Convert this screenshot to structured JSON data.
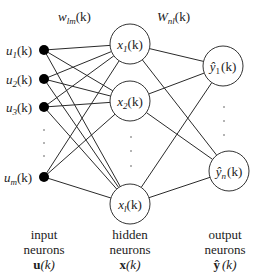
{
  "weights": {
    "input_hidden": {
      "base": "w",
      "sub": "lm",
      "arg": "(k)"
    },
    "hidden_output": {
      "base": "W",
      "sub": "nl",
      "arg": "(k)"
    }
  },
  "input_layer": {
    "nodes": [
      {
        "base": "u",
        "sub": "1",
        "arg": "(k)"
      },
      {
        "base": "u",
        "sub": "2",
        "arg": "(k)"
      },
      {
        "base": "u",
        "sub": "3",
        "arg": "(k)"
      },
      {
        "base": "u",
        "sub": "m",
        "arg": "(k)"
      }
    ],
    "caption": {
      "line1": "input",
      "line2": "neurons",
      "symbol": "u",
      "arg": "(k)"
    }
  },
  "hidden_layer": {
    "nodes": [
      {
        "base": "x",
        "sub": "1",
        "arg": "(k)"
      },
      {
        "base": "x",
        "sub": "2",
        "arg": "(k)"
      },
      {
        "base": "x",
        "sub": "l",
        "arg": "(k)"
      }
    ],
    "caption": {
      "line1": "hidden",
      "line2": "neurons",
      "symbol": "x",
      "arg": "(k)"
    }
  },
  "output_layer": {
    "nodes": [
      {
        "base": "ŷ",
        "sub": "1",
        "arg": "(k)"
      },
      {
        "base": "ŷ",
        "sub": "n",
        "arg": "(k)"
      }
    ],
    "caption": {
      "line1": "output",
      "line2": "neurons",
      "symbol": "ŷ",
      "arg": "(k)"
    }
  },
  "ellipsis": "⋮"
}
